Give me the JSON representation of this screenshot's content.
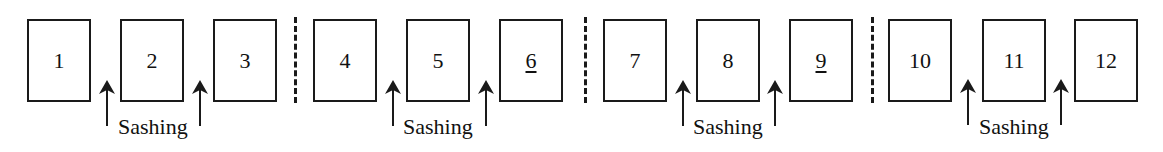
{
  "diagram": {
    "groups": [
      {
        "panels": [
          {
            "label": "1",
            "underlined": false
          },
          {
            "label": "2",
            "underlined": false
          },
          {
            "label": "3",
            "underlined": false
          }
        ],
        "sashing_label": "Sashing"
      },
      {
        "panels": [
          {
            "label": "4",
            "underlined": false
          },
          {
            "label": "5",
            "underlined": false
          },
          {
            "label": "6",
            "underlined": true
          }
        ],
        "sashing_label": "Sashing"
      },
      {
        "panels": [
          {
            "label": "7",
            "underlined": false
          },
          {
            "label": "8",
            "underlined": false
          },
          {
            "label": "9",
            "underlined": true
          }
        ],
        "sashing_label": "Sashing"
      },
      {
        "panels": [
          {
            "label": "10",
            "underlined": false
          },
          {
            "label": "11",
            "underlined": false
          },
          {
            "label": "12",
            "underlined": false
          }
        ],
        "sashing_label": "Sashing"
      }
    ],
    "dividers": 3,
    "colors": {
      "stroke": "#1a1a1a",
      "background": "#ffffff"
    }
  }
}
